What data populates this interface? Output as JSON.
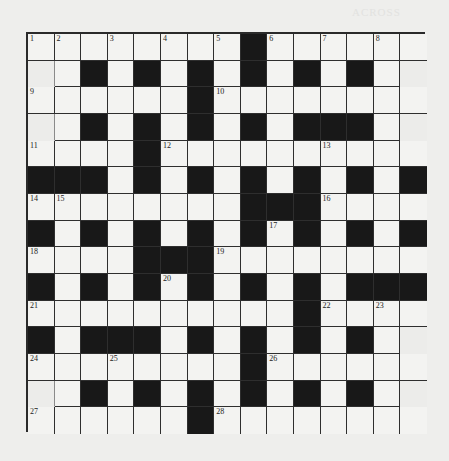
{
  "page": {
    "background": "#eeeeec",
    "bleed_through_header": "ACROSS"
  },
  "crossword": {
    "rows": 15,
    "cols": 15,
    "colors": {
      "white_cell": "#f3f3f1",
      "black_cell": "#181818",
      "faded_cell": "#ececea",
      "grid_line": "#2e2e2e"
    },
    "layout": [
      "WWWWWWWWBWWWWWW",
      "FWBWBWBWBWBWBWF",
      "WWWWWWBWWWWWWWW",
      "FWBWBWBWBWBBBWF",
      "WWWWBWWWWWWWWWW",
      "BBBWBWBWBWBWBWB",
      "WWWWWWWWBBBWWWW",
      "BWBWBWBWBWBWBWB",
      "WWWWBBBWWWWWWWW",
      "BWBWBWBWBWBWBBB",
      "WWWWWWWWWWBWWWW",
      "BWBBBWBWBWBWBWF",
      "WWWWWWWWBWWWWWW",
      "FWBWBWBWBWBWBWF",
      "WWWWWWBWWWWWWWW"
    ],
    "numbers": [
      {
        "n": "1",
        "r": 0,
        "c": 0
      },
      {
        "n": "2",
        "r": 0,
        "c": 1
      },
      {
        "n": "3",
        "r": 0,
        "c": 3
      },
      {
        "n": "4",
        "r": 0,
        "c": 5
      },
      {
        "n": "5",
        "r": 0,
        "c": 7
      },
      {
        "n": "6",
        "r": 0,
        "c": 9
      },
      {
        "n": "7",
        "r": 0,
        "c": 11
      },
      {
        "n": "8",
        "r": 0,
        "c": 13
      },
      {
        "n": "9",
        "r": 2,
        "c": 0
      },
      {
        "n": "10",
        "r": 2,
        "c": 7
      },
      {
        "n": "11",
        "r": 4,
        "c": 0
      },
      {
        "n": "12",
        "r": 4,
        "c": 5
      },
      {
        "n": "13",
        "r": 4,
        "c": 11
      },
      {
        "n": "14",
        "r": 6,
        "c": 0
      },
      {
        "n": "15",
        "r": 6,
        "c": 1
      },
      {
        "n": "16",
        "r": 6,
        "c": 11
      },
      {
        "n": "17",
        "r": 7,
        "c": 9
      },
      {
        "n": "18",
        "r": 8,
        "c": 0
      },
      {
        "n": "19",
        "r": 8,
        "c": 7
      },
      {
        "n": "20",
        "r": 9,
        "c": 5
      },
      {
        "n": "21",
        "r": 10,
        "c": 0
      },
      {
        "n": "22",
        "r": 10,
        "c": 11
      },
      {
        "n": "23",
        "r": 10,
        "c": 13
      },
      {
        "n": "24",
        "r": 12,
        "c": 0
      },
      {
        "n": "25",
        "r": 12,
        "c": 3
      },
      {
        "n": "26",
        "r": 12,
        "c": 9
      },
      {
        "n": "27",
        "r": 14,
        "c": 0
      },
      {
        "n": "28",
        "r": 14,
        "c": 7
      }
    ]
  }
}
